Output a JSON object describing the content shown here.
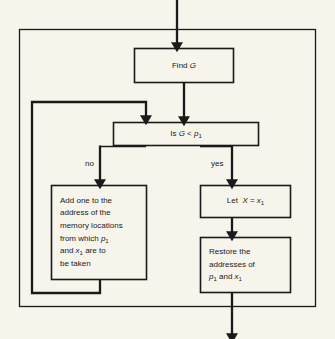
{
  "diagram": {
    "background_color": "#f7f4ec",
    "line_color": "#1a1a18",
    "nodes": {
      "find_g": {
        "label": "Find G",
        "text_plain": "Find G",
        "shape": "rectangle"
      },
      "decision": {
        "label": "Is G < p1",
        "text_plain": "Is G < p₁",
        "shape": "rectangle"
      },
      "add_one": {
        "lines": [
          "Add one to the",
          "address of the",
          "memory locations",
          "from which p₁",
          "and x₁ are to",
          "be taken"
        ],
        "text_plain": "Add one to the address of the memory locations from which p1 and x1 are to be taken",
        "shape": "rectangle"
      },
      "let_x": {
        "label": "Let X = x1",
        "text_plain": "Let X = x₁",
        "shape": "rectangle"
      },
      "restore": {
        "lines": [
          "Restore the",
          "addresses of",
          "p₁ and x₁"
        ],
        "text_plain": "Restore the addresses of p1 and x1",
        "shape": "rectangle"
      }
    },
    "edge_labels": {
      "no": "no",
      "yes": "yes"
    }
  }
}
